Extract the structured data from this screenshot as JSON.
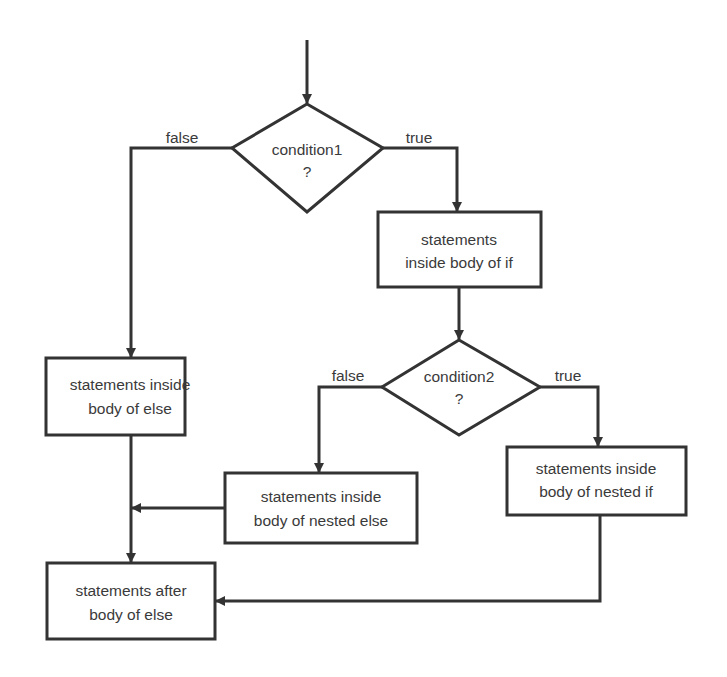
{
  "diagram": {
    "type": "flowchart",
    "title": "",
    "nodes": {
      "condition1": {
        "line1": "condition1",
        "line2": "?"
      },
      "if_body": {
        "line1": "statements",
        "line2": "inside body of if"
      },
      "condition2": {
        "line1": "condition2",
        "line2": "?"
      },
      "else_body": {
        "line1": "statements inside",
        "line2": "body of else"
      },
      "nested_else_body": {
        "line1": "statements inside",
        "line2": "body of nested else"
      },
      "nested_if_body": {
        "line1": "statements inside",
        "line2": "body of nested if"
      },
      "after_else": {
        "line1": "statements after",
        "line2": "body of else"
      }
    },
    "edges": {
      "c1_false": "false",
      "c1_true": "true",
      "c2_false": "false",
      "c2_true": "true"
    },
    "colors": {
      "stroke": "#333333",
      "text": "#3a3a3a",
      "background": "#ffffff"
    }
  }
}
